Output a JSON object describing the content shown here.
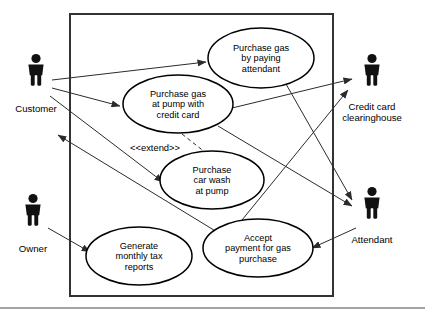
{
  "diagram": {
    "type": "uml-use-case-diagram",
    "system_boundary": {
      "x": 70,
      "y": 14,
      "width": 263,
      "height": 282
    },
    "actors": [
      {
        "id": "customer",
        "label": "Customer",
        "icon": "actor-stick-figure-icon",
        "x": 36,
        "y": 72,
        "label_x": 36,
        "label_y": 112,
        "side": "left"
      },
      {
        "id": "owner",
        "label": "Owner",
        "icon": "actor-stick-figure-icon",
        "x": 33,
        "y": 212,
        "label_x": 33,
        "label_y": 252,
        "side": "left"
      },
      {
        "id": "credit-card-clearinghouse",
        "label_line1": "Credit card",
        "label_line2": "clearinghouse",
        "label": "Credit card clearinghouse",
        "icon": "actor-stick-figure-icon",
        "x": 372,
        "y": 72,
        "label_x": 372,
        "label_y": 110,
        "side": "right"
      },
      {
        "id": "attendant",
        "label": "Attendant",
        "icon": "actor-stick-figure-icon",
        "x": 372,
        "y": 205,
        "label_x": 372,
        "label_y": 243,
        "side": "right"
      }
    ],
    "use_cases": [
      {
        "id": "purchase-gas-by-paying-attendant",
        "lines": [
          "Purchase gas",
          "by paying",
          "attendant"
        ],
        "cx": 261,
        "cy": 58,
        "rx": 53,
        "ry": 30
      },
      {
        "id": "purchase-gas-at-pump-with-credit-card",
        "lines": [
          "Purchase gas",
          "at pump with",
          "credit card"
        ],
        "cx": 178,
        "cy": 104,
        "rx": 55,
        "ry": 29
      },
      {
        "id": "purchase-car-wash-at-pump",
        "lines": [
          "Purchase",
          "car wash",
          "at pump"
        ],
        "cx": 212,
        "cy": 180,
        "rx": 52,
        "ry": 29
      },
      {
        "id": "accept-payment-for-gas-purchase",
        "lines": [
          "Accept",
          "payment for gas",
          "purchase"
        ],
        "cx": 258,
        "cy": 248,
        "rx": 55,
        "ry": 29
      },
      {
        "id": "generate-monthly-tax-reports",
        "lines": [
          "Generate",
          "monthly tax",
          "reports"
        ],
        "cx": 139,
        "cy": 256,
        "rx": 53,
        "ry": 29
      }
    ],
    "stereotype": {
      "id": "extend-stereotype",
      "text": "<<extend>>",
      "x": 155,
      "y": 151
    },
    "associations": [
      {
        "id": "customer-to-purchase-gas-by-paying-attendant",
        "from": "customer",
        "to": "purchase-gas-by-paying-attendant",
        "path": "M 52 80 L 206 62",
        "arrow": "end"
      },
      {
        "id": "customer-to-purchase-gas-at-pump",
        "from": "customer",
        "to": "purchase-gas-at-pump-with-credit-card",
        "path": "M 52 88 L 120 106",
        "arrow": "end"
      },
      {
        "id": "customer-to-purchase-car-wash",
        "from": "customer",
        "to": "purchase-car-wash-at-pump",
        "path": "M 50 96 L 163 182",
        "arrow": "end"
      },
      {
        "id": "purchase-gas-at-pump-to-clearinghouse",
        "from": "purchase-gas-at-pump-with-credit-card",
        "to": "credit-card-clearinghouse",
        "path": "M 232 108 L 352 79",
        "arrow": "end"
      },
      {
        "id": "purchase-gas-by-paying-attendant-to-attendant",
        "from": "purchase-gas-by-paying-attendant",
        "to": "attendant",
        "path": "M 286 84 L 352 200",
        "arrow": "end"
      },
      {
        "id": "purchase-gas-at-pump-to-attendant",
        "from": "purchase-gas-at-pump-with-credit-card",
        "to": "attendant",
        "path": "M 218 126 L 352 206",
        "arrow": "end"
      },
      {
        "id": "accept-payment-to-clearinghouse",
        "from": "accept-payment-for-gas-purchase",
        "to": "credit-card-clearinghouse",
        "path": "M 242 220 L 348 90",
        "arrow": "end"
      },
      {
        "id": "attendant-to-accept-payment",
        "from": "attendant",
        "to": "accept-payment-for-gas-purchase",
        "path": "M 356 228 L 312 248",
        "arrow": "end"
      },
      {
        "id": "accept-payment-to-customer",
        "from": "accept-payment-for-gas-purchase",
        "to": "customer",
        "path": "M 222 235 L 58 135",
        "arrow": "end"
      },
      {
        "id": "owner-to-generate-monthly-tax-reports",
        "from": "owner",
        "to": "generate-monthly-tax-reports",
        "path": "M 48 228 L 90 252",
        "arrow": "end"
      }
    ],
    "extend_relationships": [
      {
        "id": "extend-car-wash-from-purchase-gas-at-pump",
        "from": "purchase-gas-at-pump-with-credit-card",
        "to": "purchase-car-wash-at-pump",
        "path": "M 182 134 L 215 160",
        "arrow": "end",
        "style": "dashed"
      }
    ],
    "bottom_rule": {
      "x1": 0,
      "y1": 308,
      "x2": 425,
      "y2": 308
    }
  }
}
